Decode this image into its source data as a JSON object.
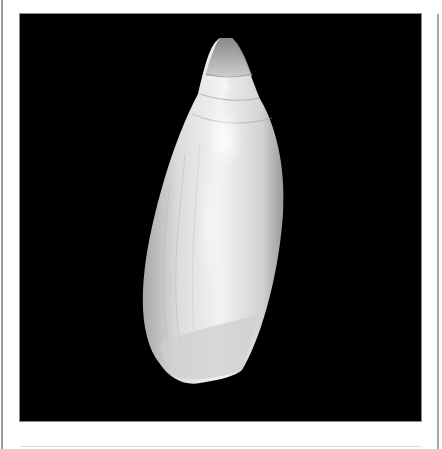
{
  "figure": {
    "background_color": "#000000",
    "frame_color": "#ffffff",
    "shell_colors": {
      "highlight": "#f4f4f4",
      "body": "#d6d6d6",
      "shadow": "#8e8e8e",
      "apex": "#9c9c9c"
    }
  }
}
